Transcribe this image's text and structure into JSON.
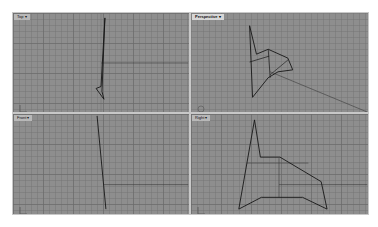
{
  "app": {
    "name": "Rhino 3D modeling viewports"
  },
  "colors": {
    "viewport_bg": "#8e8e8e",
    "grid_minor": "#7a7a7a",
    "grid_major": "#6a6a6a",
    "axis_line": "#3a3a3a",
    "geometry": "#151515",
    "title_bg": "#b8b8b8"
  },
  "viewports": [
    {
      "id": "top",
      "title": "Top",
      "active": false
    },
    {
      "id": "perspective",
      "title": "Perspective",
      "active": true
    },
    {
      "id": "front",
      "title": "Front",
      "active": false
    },
    {
      "id": "right",
      "title": "Right",
      "active": false
    }
  ],
  "icons": {
    "title_dropdown": "chevron-down-icon",
    "world_axes": "world-axes-icon"
  }
}
